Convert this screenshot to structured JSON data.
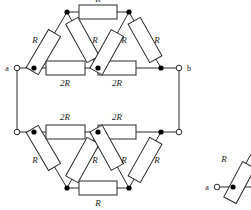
{
  "figure": {
    "type": "circuit-diagram",
    "title": "",
    "background_color": "#ffffff",
    "line_color": "#2b2b2b",
    "label_color": "#1a1a1a",
    "node_fill": "#000000",
    "terminal_fill": "#ffffff"
  },
  "main_circuit": {
    "terminals": [
      {
        "id": "a",
        "label": "a",
        "position": "left-upper"
      },
      {
        "id": "b",
        "label": "b",
        "position": "right-upper"
      },
      {
        "id": "a2",
        "label": "",
        "position": "left-lower"
      },
      {
        "id": "b2",
        "label": "",
        "position": "right-lower"
      }
    ],
    "top_section": {
      "horizontal_branch": [
        {
          "label": "2R",
          "label_position": "below"
        },
        {
          "label": "2R",
          "label_position": "below"
        }
      ],
      "apex_branch": [
        {
          "label": "R",
          "label_position": "above"
        }
      ],
      "diagonals": [
        {
          "label": "R",
          "label_position": "left"
        },
        {
          "label": "R",
          "label_position": "right"
        },
        {
          "label": "R",
          "label_position": "left"
        },
        {
          "label": "R",
          "label_position": "right"
        }
      ]
    },
    "bottom_section": {
      "horizontal_branch": [
        {
          "label": "2R",
          "label_position": "above"
        },
        {
          "label": "2R",
          "label_position": "above"
        }
      ],
      "apex_branch": [
        {
          "label": "R",
          "label_position": "below"
        }
      ],
      "diagonals": [
        {
          "label": "R",
          "label_position": "left"
        },
        {
          "label": "R",
          "label_position": "right"
        },
        {
          "label": "R",
          "label_position": "left"
        },
        {
          "label": "R",
          "label_position": "right"
        }
      ]
    }
  },
  "secondary_circuit": {
    "cropped": true,
    "terminals": [
      {
        "id": "a",
        "label": "a",
        "position": "left"
      }
    ],
    "resistors": [
      {
        "label": "R",
        "label_position": "left"
      }
    ]
  }
}
